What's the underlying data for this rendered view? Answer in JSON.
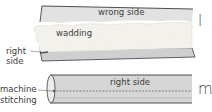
{
  "figure_l": {
    "step_letter": "l",
    "labels": {
      "wrong_side": "wrong side",
      "wadding": "wadding",
      "right_side": "right side"
    }
  },
  "figure_m": {
    "step_letter": "m",
    "labels": {
      "right_side": "right side",
      "machine_stitching": "machine stitching"
    }
  },
  "colors": {
    "fabric": "#d9d9d9",
    "fabric_dark": "#bdbdbd",
    "wadding": "#f3f2ee",
    "outline": "#3c3c3c"
  }
}
